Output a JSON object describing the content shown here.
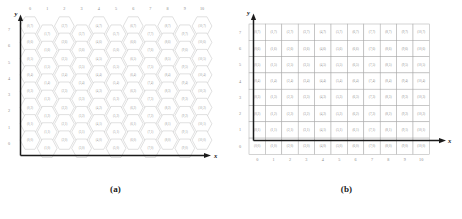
{
  "figure": {
    "panels": [
      {
        "id": "a",
        "caption": "(a)",
        "type": "hexagonal-grid",
        "axis": {
          "x_label": "x",
          "y_label": "y",
          "x_ticks": [
            "0",
            "1",
            "2",
            "3",
            "4",
            "5",
            "6",
            "7",
            "8",
            "9",
            "10"
          ],
          "y_ticks": [
            "0",
            "1",
            "2",
            "3",
            "4",
            "5",
            "6",
            "7"
          ],
          "x_ticks_position": "top",
          "y_ticks_position": "left"
        },
        "cols": 11,
        "rows": 8,
        "cell_label_format": "(x,y)"
      },
      {
        "id": "b",
        "caption": "(b)",
        "type": "square-grid",
        "axis": {
          "x_label": "x",
          "y_label": "y",
          "x_ticks": [
            "0",
            "1",
            "2",
            "3",
            "4",
            "5",
            "6",
            "7",
            "8",
            "9",
            "10"
          ],
          "y_ticks": [
            "0",
            "1",
            "2",
            "3",
            "4",
            "5",
            "6",
            "7"
          ],
          "x_ticks_position": "bottom",
          "y_ticks_position": "left"
        },
        "cols": 11,
        "rows": 8,
        "cell_label_format": "(x,y)"
      }
    ],
    "colors": {
      "cell_stroke_hex": "#b9b9b9",
      "cell_stroke_square": "#a8a8a8",
      "cell_text": "#9a9a9a",
      "tick_text": "#8a8a8a",
      "axis": "#1b1b1b",
      "background": "#ffffff"
    }
  },
  "chart_data": {
    "type": "table",
    "title": "",
    "xlabel": "x",
    "ylabel": "y",
    "xlim": [
      0,
      10
    ],
    "ylim": [
      0,
      7
    ],
    "grid": true,
    "legend": "none",
    "panels": [
      {
        "name": "(a)",
        "layout": "hexagonal",
        "description": "Honeycomb tiling of cells addressed by (x,y); odd x columns offset vertically by half a cell.",
        "x_values": [
          0,
          1,
          2,
          3,
          4,
          5,
          6,
          7,
          8,
          9,
          10
        ],
        "y_values": [
          0,
          1,
          2,
          3,
          4,
          5,
          6,
          7
        ],
        "cells": [
          [
            "(0,7)",
            "(1,7)",
            "(2,7)",
            "(3,7)",
            "(4,7)",
            "(5,7)",
            "(6,7)",
            "(7,7)",
            "(8,7)",
            "(9,7)",
            "(10,7)"
          ],
          [
            "(0,6)",
            "(1,6)",
            "(2,6)",
            "(3,6)",
            "(4,6)",
            "(5,6)",
            "(6,6)",
            "(7,6)",
            "(8,6)",
            "(9,6)",
            "(10,6)"
          ],
          [
            "(0,5)",
            "(1,5)",
            "(2,5)",
            "(3,5)",
            "(4,5)",
            "(5,5)",
            "(6,5)",
            "(7,5)",
            "(8,5)",
            "(9,5)",
            "(10,5)"
          ],
          [
            "(0,4)",
            "(1,4)",
            "(2,4)",
            "(3,4)",
            "(4,4)",
            "(5,4)",
            "(6,4)",
            "(7,4)",
            "(8,4)",
            "(9,4)",
            "(10,4)"
          ],
          [
            "(0,3)",
            "(1,3)",
            "(2,3)",
            "(3,3)",
            "(4,3)",
            "(5,3)",
            "(6,3)",
            "(7,3)",
            "(8,3)",
            "(9,3)",
            "(10,3)"
          ],
          [
            "(0,2)",
            "(1,2)",
            "(2,2)",
            "(3,2)",
            "(4,2)",
            "(5,2)",
            "(6,2)",
            "(7,2)",
            "(8,2)",
            "(9,2)",
            "(10,2)"
          ],
          [
            "(0,1)",
            "(1,1)",
            "(2,1)",
            "(3,1)",
            "(4,1)",
            "(5,1)",
            "(6,1)",
            "(7,1)",
            "(8,1)",
            "(9,1)",
            "(10,1)"
          ],
          [
            "(0,0)",
            "(1,0)",
            "(2,0)",
            "(3,0)",
            "(4,0)",
            "(5,0)",
            "(6,0)",
            "(7,0)",
            "(8,0)",
            "(9,0)",
            "(10,0)"
          ]
        ]
      },
      {
        "name": "(b)",
        "layout": "rectangular",
        "description": "Square grid of cells addressed by (x,y).",
        "x_values": [
          0,
          1,
          2,
          3,
          4,
          5,
          6,
          7,
          8,
          9,
          10
        ],
        "y_values": [
          0,
          1,
          2,
          3,
          4,
          5,
          6,
          7
        ],
        "cells": [
          [
            "(0,7)",
            "(1,7)",
            "(2,7)",
            "(3,7)",
            "(4,7)",
            "(5,7)",
            "(6,7)",
            "(7,7)",
            "(8,7)",
            "(9,7)",
            "(10,7)"
          ],
          [
            "(0,6)",
            "(1,6)",
            "(2,6)",
            "(3,6)",
            "(4,6)",
            "(5,6)",
            "(6,6)",
            "(7,6)",
            "(8,6)",
            "(9,6)",
            "(10,6)"
          ],
          [
            "(0,5)",
            "(1,5)",
            "(2,5)",
            "(3,5)",
            "(4,5)",
            "(5,5)",
            "(6,5)",
            "(7,5)",
            "(8,5)",
            "(9,5)",
            "(10,5)"
          ],
          [
            "(0,4)",
            "(1,4)",
            "(2,4)",
            "(3,4)",
            "(4,4)",
            "(5,4)",
            "(6,4)",
            "(7,4)",
            "(8,4)",
            "(9,4)",
            "(10,4)"
          ],
          [
            "(0,3)",
            "(1,3)",
            "(2,3)",
            "(3,3)",
            "(4,3)",
            "(5,3)",
            "(6,3)",
            "(7,3)",
            "(8,3)",
            "(9,3)",
            "(10,3)"
          ],
          [
            "(0,2)",
            "(1,2)",
            "(2,2)",
            "(3,2)",
            "(4,2)",
            "(5,2)",
            "(6,2)",
            "(7,2)",
            "(8,2)",
            "(9,2)",
            "(10,2)"
          ],
          [
            "(0,1)",
            "(1,1)",
            "(2,1)",
            "(3,1)",
            "(4,1)",
            "(5,1)",
            "(6,1)",
            "(7,1)",
            "(8,1)",
            "(9,1)",
            "(10,1)"
          ],
          [
            "(0,0)",
            "(1,0)",
            "(2,0)",
            "(3,0)",
            "(4,0)",
            "(5,0)",
            "(6,0)",
            "(7,0)",
            "(8,0)",
            "(9,0)",
            "(10,0)"
          ]
        ]
      }
    ]
  }
}
